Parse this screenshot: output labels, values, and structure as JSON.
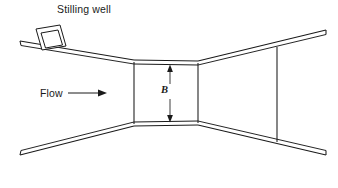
{
  "figure": {
    "background_color": "#ffffff",
    "line_color": "#1a1a1a",
    "width": 338,
    "height": 188
  },
  "labels": {
    "stilling_well": "Stilling  well",
    "flow": "Flow",
    "throat_width": "B"
  },
  "icons": {
    "flow_arrow": "arrow-right-icon",
    "dimension_arrow": "double-headed-vertical-arrow-icon"
  },
  "geometry": {
    "throat": {
      "left_x": 134,
      "right_x": 198,
      "top_y": 62,
      "bottom_y": 124
    },
    "inlet": {
      "upper_outer_start": [
        20,
        41
      ],
      "upper_outer_end": [
        134,
        60
      ],
      "lower_outer_start": [
        20,
        155
      ],
      "lower_outer_end": [
        134,
        126
      ]
    },
    "outlet": {
      "upper_outer_start": [
        198,
        61
      ],
      "upper_outer_end": [
        326,
        30
      ],
      "lower_outer_start": [
        198,
        125
      ],
      "lower_outer_end": [
        326,
        155
      ]
    },
    "downstream_gauge_line": {
      "x": 277,
      "top_y": 47,
      "bottom_y": 142
    },
    "stilling_well_box": {
      "center": [
        53,
        32
      ],
      "width": 26,
      "height": 24,
      "rotation_deg": 9
    },
    "dimension_arrow": {
      "x": 170,
      "top_y": 66,
      "bottom_y": 121
    },
    "flow_arrow": {
      "start_x": 68,
      "end_x": 105,
      "y": 93
    }
  }
}
